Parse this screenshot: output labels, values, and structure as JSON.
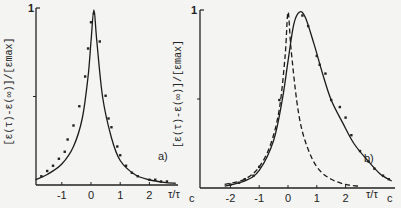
{
  "chart_data": [
    {
      "type": "line",
      "panel_label": "a)",
      "xlabel": "τ/τc",
      "ylabel": "[ε(τ)-ε(∞)]/[εmax]",
      "xticks": [
        "-1",
        "0",
        "1",
        "2"
      ],
      "yticks": [
        "1"
      ],
      "xlim": [
        -1.9,
        2.9
      ],
      "ylim": [
        0,
        1
      ],
      "series": [
        {
          "name": "fit",
          "style": "solid",
          "x": [
            -1.9,
            -1.5,
            -1.0,
            -0.6,
            -0.3,
            -0.1,
            0.0,
            0.1,
            0.2,
            0.4,
            0.7,
            1.0,
            1.5,
            2.0,
            2.5,
            2.9
          ],
          "y": [
            0.03,
            0.06,
            0.12,
            0.22,
            0.38,
            0.62,
            0.82,
            1.0,
            0.82,
            0.5,
            0.27,
            0.14,
            0.06,
            0.03,
            0.015,
            0.01
          ]
        },
        {
          "name": "data",
          "style": "points",
          "x": [
            -1.7,
            -1.5,
            -1.3,
            -1.1,
            -0.9,
            -0.8,
            -0.6,
            -0.4,
            -0.2,
            -0.1,
            0.0,
            0.1,
            0.3,
            0.5,
            0.6,
            0.7,
            0.9,
            1.0,
            1.2,
            1.4,
            1.6,
            2.0,
            2.2,
            2.4,
            2.6
          ],
          "y": [
            0.05,
            0.08,
            0.11,
            0.15,
            0.19,
            0.26,
            0.34,
            0.45,
            0.62,
            0.78,
            0.93,
            0.98,
            0.82,
            0.51,
            0.38,
            0.33,
            0.22,
            0.17,
            0.11,
            0.07,
            0.05,
            0.03,
            0.03,
            0.02,
            0.02
          ]
        }
      ]
    },
    {
      "type": "line",
      "panel_label": "b)",
      "xlabel": "τ/τc",
      "ylabel": "[ε(τ)-ε(∞)]/[εmax]",
      "xticks": [
        "-2",
        "-1",
        "0",
        "1",
        "2"
      ],
      "yticks": [
        "1"
      ],
      "xlim": [
        -2.5,
        3.7
      ],
      "ylim": [
        0,
        1
      ],
      "series": [
        {
          "name": "fit",
          "style": "solid",
          "x": [
            -2.2,
            -1.5,
            -1.0,
            -0.5,
            -0.2,
            0.0,
            0.2,
            0.4,
            0.6,
            0.9,
            1.2,
            1.5,
            1.9,
            2.3,
            2.8,
            3.2,
            3.6
          ],
          "y": [
            0.01,
            0.04,
            0.1,
            0.27,
            0.5,
            0.72,
            0.93,
            1.0,
            0.97,
            0.82,
            0.65,
            0.5,
            0.37,
            0.25,
            0.15,
            0.08,
            0.04
          ]
        },
        {
          "name": "reference",
          "style": "dashed",
          "x": [
            -2.2,
            -1.5,
            -1.0,
            -0.6,
            -0.3,
            -0.1,
            0.0,
            0.1,
            0.3,
            0.5,
            0.8,
            1.1,
            1.5,
            2.0,
            2.5
          ],
          "y": [
            0.02,
            0.05,
            0.12,
            0.25,
            0.45,
            0.75,
            1.0,
            0.8,
            0.5,
            0.32,
            0.18,
            0.1,
            0.05,
            0.02,
            0.01
          ]
        },
        {
          "name": "data",
          "style": "points",
          "x": [
            -2.0,
            -1.7,
            -1.5,
            -1.2,
            -1.0,
            -0.3,
            0.5,
            0.7,
            1.0,
            1.1,
            1.3,
            1.5,
            1.8,
            2.0,
            2.2,
            2.5,
            2.8,
            3.0,
            3.3,
            3.5
          ],
          "y": [
            0.02,
            0.03,
            0.05,
            0.07,
            0.12,
            0.5,
            0.98,
            0.92,
            0.75,
            0.7,
            0.65,
            0.5,
            0.46,
            0.4,
            0.3,
            0.21,
            0.15,
            0.11,
            0.07,
            0.05
          ]
        }
      ]
    }
  ]
}
